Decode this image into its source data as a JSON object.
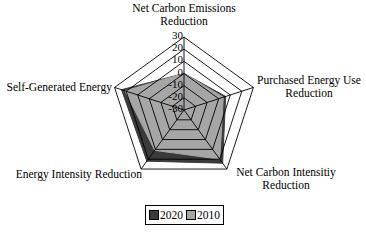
{
  "chart_data": {
    "type": "radar",
    "title": "",
    "axes": [
      "Net Carbon Emissions Reduction",
      "Purchased Energy Use Reduction",
      "Net Carbon Intensitiy Reduction",
      "Energy Intensity Reduction",
      "Self-Generated Energy"
    ],
    "rlim": [
      -30,
      30
    ],
    "rticks": [
      30,
      20,
      10,
      0,
      -10,
      -20,
      -30
    ],
    "series": [
      {
        "name": "2020",
        "color": "#3a3a3a",
        "values": [
          0,
          6,
          24,
          22,
          24
        ]
      },
      {
        "name": "2010",
        "color": "#a6a6a6",
        "values": [
          0,
          4,
          20,
          11,
          21
        ]
      }
    ],
    "legend_position": "bottom",
    "grid": true
  },
  "labels": {
    "axis0_line1": "Net Carbon Emissions",
    "axis0_line2": "Reduction",
    "axis1_line1": "Purchased Energy Use",
    "axis1_line2": "Reduction",
    "axis2_line1": "Net Carbon Intensitiy",
    "axis2_line2": "Reduction",
    "axis3_line1": "Energy Intensity Reduction",
    "axis4_line1": "Self-Generated Energy"
  },
  "legend": {
    "items": [
      {
        "label": "2020",
        "color": "#3a3a3a"
      },
      {
        "label": "2010",
        "color": "#a6a6a6"
      }
    ]
  }
}
